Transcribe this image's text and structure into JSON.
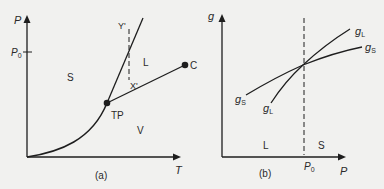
{
  "panel_a": {
    "caption": "(a)",
    "y_axis_label": "P",
    "x_axis_label": "T",
    "p0_label": "P",
    "p0_sub": "0",
    "regions": {
      "solid": "S",
      "liquid": "L",
      "vapor": "V"
    },
    "triple_point": "TP",
    "critical_point": "C",
    "point_y": "Y'",
    "point_x": "X'"
  },
  "panel_b": {
    "caption": "(b)",
    "y_axis_label": "g",
    "x_axis_label": "P",
    "p0_label": "P",
    "p0_sub": "0",
    "regions": {
      "left": "L",
      "right": "S"
    },
    "curve_liquid": {
      "main": "g",
      "sub": "L"
    },
    "curve_solid": {
      "main": "g",
      "sub": "S"
    }
  },
  "colors": {
    "line": "#1e1e1e",
    "background": "#f1f1ef",
    "text": "#2a2a2a"
  }
}
